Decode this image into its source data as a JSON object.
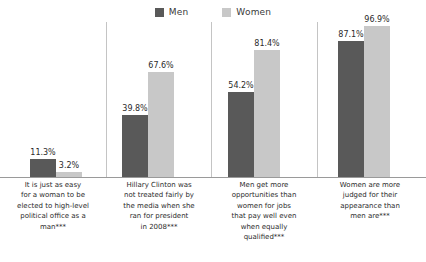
{
  "legend": {
    "position": "top-center",
    "entries": [
      {
        "label": "Men",
        "color": "#595959",
        "icon": "legend-swatch-icon"
      },
      {
        "label": "Women",
        "color": "#c8c8c8",
        "icon": "legend-swatch-icon"
      }
    ]
  },
  "axis": {
    "baseline_color": "#9a9a9a",
    "separator_color": "#c4c4c4",
    "grid": false,
    "y_visible": false
  },
  "chart_data": {
    "type": "bar",
    "title": "",
    "subtitle": "",
    "xlabel": "",
    "ylabel": "",
    "ylim": [
      0,
      100
    ],
    "grid": false,
    "legend_position": "top-center",
    "value_suffix": "%",
    "categories": [
      "It is just as easy for a woman to be elected to high-level political office as a man***",
      "Hillary Clinton was not treated fairly by the media when she ran for president in 2008***",
      "Men get more opportunities than women for jobs that pay well even when equally qualified***",
      "Women are more judged for their appearance than men are***"
    ],
    "category_lines": [
      [
        "It is just as easy",
        "for a woman to be",
        "elected to high-level",
        "political office as a",
        "man***"
      ],
      [
        "Hillary Clinton was",
        "not treated fairly by",
        "the media when she",
        "ran for president",
        "in 2008***"
      ],
      [
        "Men get more",
        "opportunities than",
        "women for jobs",
        "that pay well even",
        "when equally",
        "qualified***"
      ],
      [
        "Women are more",
        "judged for their",
        "appearance than",
        "men are***"
      ]
    ],
    "series": [
      {
        "name": "Men",
        "color": "#595959",
        "values": [
          11.3,
          39.8,
          54.2,
          87.1
        ],
        "labels": [
          "11.3%",
          "39.8%",
          "54.2%",
          "87.1%"
        ]
      },
      {
        "name": "Women",
        "color": "#c8c8c8",
        "values": [
          3.2,
          67.6,
          81.4,
          96.9
        ],
        "labels": [
          "3.2%",
          "67.6%",
          "81.4%",
          "96.9%"
        ]
      }
    ]
  }
}
